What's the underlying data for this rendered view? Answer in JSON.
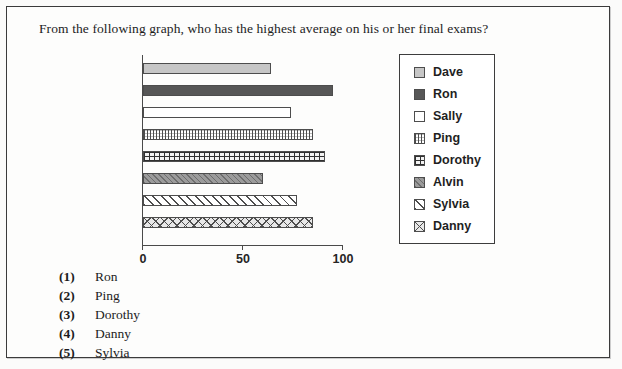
{
  "question": "From the following graph, who has the highest average on his or her final exams?",
  "chart_data": {
    "type": "bar",
    "orientation": "horizontal",
    "title": "",
    "xlabel": "",
    "ylabel": "",
    "xlim": [
      0,
      100
    ],
    "xticks": [
      "0",
      "50",
      "100"
    ],
    "grid": false,
    "legend_position": "right",
    "categories": [
      "Dave",
      "Ron",
      "Sally",
      "Ping",
      "Dorothy",
      "Alvin",
      "Sylvia",
      "Danny"
    ],
    "values": [
      64,
      95,
      74,
      85,
      91,
      60,
      77,
      85
    ],
    "series": [
      {
        "name": "Final exam average",
        "values": [
          64,
          95,
          74,
          85,
          91,
          60,
          77,
          85
        ]
      }
    ],
    "bars": [
      {
        "label": "Dave",
        "value": 64,
        "pattern": "solid-light-gray"
      },
      {
        "label": "Ron",
        "value": 95,
        "pattern": "solid-dark-gray"
      },
      {
        "label": "Sally",
        "value": 74,
        "pattern": "white"
      },
      {
        "label": "Ping",
        "value": 85,
        "pattern": "dotted"
      },
      {
        "label": "Dorothy",
        "value": 91,
        "pattern": "grid"
      },
      {
        "label": "Alvin",
        "value": 60,
        "pattern": "dense-diagonal-gray"
      },
      {
        "label": "Sylvia",
        "value": 77,
        "pattern": "diagonal-stripes"
      },
      {
        "label": "Danny",
        "value": 85,
        "pattern": "crosshatch"
      }
    ]
  },
  "legend": {
    "items": [
      {
        "label": "Dave",
        "pattern": "solid-light-gray"
      },
      {
        "label": "Ron",
        "pattern": "solid-dark-gray"
      },
      {
        "label": "Sally",
        "pattern": "white"
      },
      {
        "label": "Ping",
        "pattern": "dotted"
      },
      {
        "label": "Dorothy",
        "pattern": "grid"
      },
      {
        "label": "Alvin",
        "pattern": "dense-diagonal-gray"
      },
      {
        "label": "Sylvia",
        "pattern": "diagonal-stripes"
      },
      {
        "label": "Danny",
        "pattern": "crosshatch"
      }
    ]
  },
  "options": [
    {
      "num": "(1)",
      "text": "Ron"
    },
    {
      "num": "(2)",
      "text": "Ping"
    },
    {
      "num": "(3)",
      "text": "Dorothy"
    },
    {
      "num": "(4)",
      "text": "Danny"
    },
    {
      "num": "(5)",
      "text": "Sylvia"
    }
  ],
  "colors": {
    "border": "#3b3b3b",
    "axis": "#4a4a4a",
    "text": "#1c1c1c",
    "bar_light": "#c6c6c6",
    "bar_dark": "#575757",
    "page_background": "#fbfbfa"
  }
}
